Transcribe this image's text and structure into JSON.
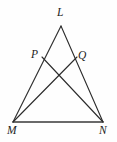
{
  "figure": {
    "canvas": {
      "width": 117,
      "height": 142
    },
    "background_color": "#fefefe",
    "line_color": "#2b2b2b",
    "label_color": "#1c1c1c"
  },
  "labels": {
    "L": "L",
    "P": "P",
    "Q": "Q",
    "M": "M",
    "N": "N"
  },
  "points": {
    "L": {
      "x": 61,
      "y": 26
    },
    "P": {
      "x": 42,
      "y": 57
    },
    "Q": {
      "x": 77,
      "y": 57
    },
    "M": {
      "x": 13,
      "y": 122
    },
    "N": {
      "x": 103,
      "y": 122
    },
    "X": {
      "x": 60,
      "y": 79
    }
  },
  "segments": [
    {
      "name": "LM",
      "from": "L",
      "to": "M"
    },
    {
      "name": "LN",
      "from": "L",
      "to": "N"
    },
    {
      "name": "MN",
      "from": "M",
      "to": "N"
    },
    {
      "name": "PN",
      "from": "P",
      "to": "N"
    },
    {
      "name": "QM",
      "from": "Q",
      "to": "M"
    }
  ]
}
